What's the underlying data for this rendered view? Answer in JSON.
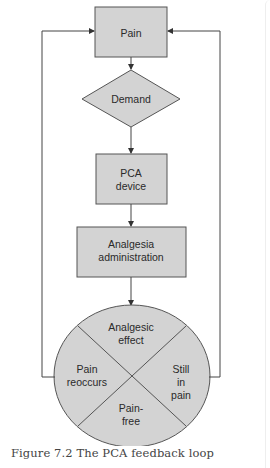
{
  "figure": {
    "caption": "Figure 7.2  The PCA feedback loop",
    "colors": {
      "fill": "#d3d3d3",
      "stroke": "#555555",
      "text": "#2a2a2a",
      "background": "#ffffff"
    },
    "nodes": {
      "pain": {
        "label": "Pain",
        "shape": "rectangle"
      },
      "demand": {
        "label": "Demand",
        "shape": "diamond"
      },
      "pca_device": {
        "label_line1": "PCA",
        "label_line2": "device",
        "shape": "rectangle"
      },
      "analgesia": {
        "label_line1": "Analgesia",
        "label_line2": "administration",
        "shape": "rectangle"
      },
      "outcome_circle": {
        "shape": "circle divided into 4 quadrants",
        "top": {
          "line1": "Analgesic",
          "line2": "effect"
        },
        "left": {
          "line1": "Pain",
          "line2": "reoccurs"
        },
        "right": {
          "line1": "Still",
          "line2": "in",
          "line3": "pain"
        },
        "bottom": {
          "line1": "Pain-",
          "line2": "free"
        }
      }
    },
    "edges": [
      "Pain -> Demand",
      "Demand -> PCA device",
      "PCA device -> Analgesia administration",
      "Analgesia administration -> Outcome circle",
      "Outcome circle (left: Pain reoccurs) -> Pain",
      "Outcome circle (right: Still in pain) -> Pain"
    ]
  }
}
